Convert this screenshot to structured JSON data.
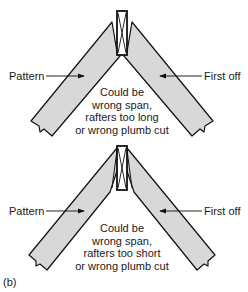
{
  "figure_label": "(b)",
  "colors": {
    "rafter_fill": "#d8d8d8",
    "stroke": "#111111",
    "background": "#ffffff"
  },
  "diagrams": [
    {
      "id": "rafters-too-long",
      "left_label": "Pattern",
      "right_label": "First off",
      "note_lines": [
        "Could be",
        "wrong span,",
        "rafters too long",
        "or wrong plumb cut"
      ]
    },
    {
      "id": "rafters-too-short",
      "left_label": "Pattern",
      "right_label": "First off",
      "note_lines": [
        "Could be",
        "wrong span,",
        "rafters too short",
        "or wrong plumb cut"
      ]
    }
  ]
}
